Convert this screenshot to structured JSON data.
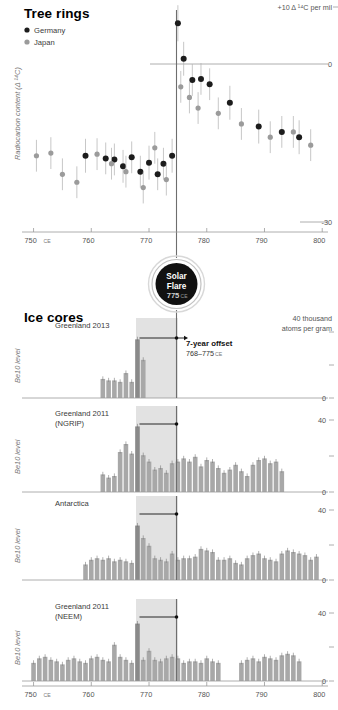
{
  "figure": {
    "sections": {
      "tree_rings": {
        "title": "Tree rings",
        "corner_note": "+10 Δ ¹⁴C per mil",
        "y_axis_label": "Radiocarbon content (Δ ¹⁴C)",
        "y_ticks": [
          {
            "label": "0",
            "value": 0
          },
          {
            "label": "-30",
            "value": -30
          }
        ],
        "legend": [
          {
            "label": "Germany",
            "color": "#1c1c1c"
          },
          {
            "label": "Japan",
            "color": "#9b9b9b"
          }
        ],
        "x_ticks": [
          "750",
          "760",
          "770",
          "780",
          "790",
          "800"
        ],
        "x_first_suffix": "CE"
      },
      "solar_flare_badge": {
        "line1": "Solar",
        "line2": "Flare",
        "year": "775",
        "era": "CE"
      },
      "ice_cores": {
        "title": "Ice cores",
        "corner_note_line1": "40 thousand",
        "corner_note_line2": "atoms per gram",
        "y_axis_label": "Be10 level",
        "annotation": {
          "bold": "7-year offset",
          "range": "768–775",
          "era": "CE"
        },
        "panels": [
          {
            "name": "Greenland 2013",
            "name2": "",
            "y_ticks": [
              "",
              "",
              "0"
            ]
          },
          {
            "name": "Greenland 2011",
            "name2": "(NGRIP)",
            "y_ticks": [
              "40",
              "",
              "0"
            ]
          },
          {
            "name": "Antarctica",
            "name2": "",
            "y_ticks": [
              "40",
              "",
              "0"
            ]
          },
          {
            "name": "Greenland 2011",
            "name2": "(NEEM)",
            "y_ticks": [
              "40",
              "",
              "0"
            ]
          }
        ],
        "x_ticks": [
          "750",
          "760",
          "770",
          "780",
          "790",
          "800"
        ],
        "x_first_suffix": "CE"
      }
    }
  },
  "chart_data": [
    {
      "type": "scatter",
      "title": "Tree rings",
      "xlabel": "Year (CE)",
      "ylabel": "Radiocarbon content (Δ ¹⁴C)",
      "xlim": [
        748,
        801
      ],
      "ylim": [
        -30,
        10
      ],
      "grid": false,
      "legend_position": "top-left",
      "annotations": [
        "+10 Δ ¹⁴C per mil",
        "Solar Flare 775 CE"
      ],
      "series": [
        {
          "name": "Germany",
          "color": "#1c1c1c",
          "points": [
            {
              "x": 759,
              "y": -17.5,
              "err": 3.2
            },
            {
              "x": 762.5,
              "y": -18.0,
              "err": 3.0
            },
            {
              "x": 764,
              "y": -18.2,
              "err": 3.0
            },
            {
              "x": 765.5,
              "y": -19.5,
              "err": 3.1
            },
            {
              "x": 767,
              "y": -17.8,
              "err": 3.0
            },
            {
              "x": 768.5,
              "y": -20.5,
              "err": 3.0
            },
            {
              "x": 770,
              "y": -18.8,
              "err": 3.2
            },
            {
              "x": 771.5,
              "y": -21.0,
              "err": 3.0
            },
            {
              "x": 772.5,
              "y": -19.0,
              "err": 3.0
            },
            {
              "x": 774,
              "y": -17.5,
              "err": 3.2
            },
            {
              "x": 775,
              "y": 7.5,
              "err": 3.4
            },
            {
              "x": 776,
              "y": 0.8,
              "err": 3.2
            },
            {
              "x": 777.5,
              "y": -3.2,
              "err": 3.0
            },
            {
              "x": 779,
              "y": -3.0,
              "err": 3.0
            },
            {
              "x": 780.5,
              "y": -4.0,
              "err": 3.0
            },
            {
              "x": 784,
              "y": -7.5,
              "err": 3.2
            },
            {
              "x": 789,
              "y": -12.0,
              "err": 3.2
            },
            {
              "x": 793,
              "y": -13.0,
              "err": 3.0
            },
            {
              "x": 796,
              "y": -14.0,
              "err": 3.2
            }
          ]
        },
        {
          "name": "Japan",
          "color": "#9b9b9b",
          "points": [
            {
              "x": 750.5,
              "y": -17.5,
              "err": 3.0
            },
            {
              "x": 753,
              "y": -17.0,
              "err": 3.0
            },
            {
              "x": 755,
              "y": -21.0,
              "err": 3.0
            },
            {
              "x": 757.5,
              "y": -22.5,
              "err": 3.0
            },
            {
              "x": 761,
              "y": -17.2,
              "err": 3.0
            },
            {
              "x": 763.5,
              "y": -19.0,
              "err": 3.0
            },
            {
              "x": 766,
              "y": -20.5,
              "err": 3.0
            },
            {
              "x": 769,
              "y": -23.5,
              "err": 3.0
            },
            {
              "x": 771,
              "y": -16.0,
              "err": 3.0
            },
            {
              "x": 773,
              "y": -22.0,
              "err": 3.0
            },
            {
              "x": 775.5,
              "y": -4.5,
              "err": 3.0
            },
            {
              "x": 777,
              "y": -6.5,
              "err": 3.0
            },
            {
              "x": 778.5,
              "y": -8.5,
              "err": 3.0
            },
            {
              "x": 782,
              "y": -9.5,
              "err": 3.0
            },
            {
              "x": 786,
              "y": -11.5,
              "err": 3.0
            },
            {
              "x": 791,
              "y": -14.0,
              "err": 3.0
            },
            {
              "x": 795,
              "y": -13.0,
              "err": 3.0
            },
            {
              "x": 798,
              "y": -15.5,
              "err": 3.0
            }
          ]
        }
      ]
    },
    {
      "type": "bar",
      "title": "Greenland 2013",
      "ylabel": "Be10 level",
      "xlabel": "Year (CE)",
      "xlim": [
        748,
        801
      ],
      "ylim": [
        0,
        45
      ],
      "highlight_band": [
        768,
        775
      ],
      "peak_year": 768,
      "x": [
        762,
        763,
        764,
        765,
        766,
        767,
        768,
        769
      ],
      "values": [
        13,
        12,
        12,
        11,
        17,
        11,
        40,
        26
      ]
    },
    {
      "type": "bar",
      "title": "Greenland 2011 (NGRIP)",
      "ylabel": "Be10 level",
      "xlabel": "Year (CE)",
      "xlim": [
        748,
        801
      ],
      "ylim": [
        0,
        45
      ],
      "highlight_band": [
        768,
        775
      ],
      "peak_year": 768,
      "x": [
        762,
        763,
        764,
        765,
        766,
        767,
        768,
        769,
        770,
        771,
        772,
        773,
        774,
        775,
        776,
        777,
        778,
        779,
        780,
        781,
        782,
        783,
        784,
        785,
        786,
        787,
        788,
        789,
        790,
        791,
        792,
        793
      ],
      "values": [
        11,
        9,
        10,
        25,
        30,
        24,
        41,
        23,
        19,
        14,
        15,
        12,
        18,
        19,
        21,
        19,
        22,
        16,
        20,
        19,
        15,
        12,
        14,
        17,
        13,
        10,
        17,
        20,
        21,
        18,
        19,
        13
      ]
    },
    {
      "type": "bar",
      "title": "Antarctica",
      "ylabel": "Be10 level",
      "xlabel": "Year (CE)",
      "xlim": [
        748,
        801
      ],
      "ylim": [
        0,
        45
      ],
      "highlight_band": [
        768,
        775
      ],
      "peak_year": 768,
      "x": [
        759,
        760,
        761,
        762,
        763,
        764,
        765,
        766,
        767,
        768,
        769,
        770,
        771,
        772,
        773,
        774,
        775,
        776,
        777,
        778,
        779,
        780,
        781,
        782,
        783,
        784,
        785,
        786,
        787,
        788,
        789,
        790,
        791,
        792,
        793,
        794,
        795,
        796,
        797,
        798,
        799
      ],
      "values": [
        10,
        13,
        14,
        13,
        14,
        12,
        13,
        12,
        11,
        35,
        27,
        22,
        14,
        13,
        12,
        17,
        13,
        14,
        14,
        15,
        20,
        19,
        18,
        13,
        13,
        14,
        11,
        10,
        14,
        16,
        17,
        14,
        13,
        12,
        17,
        19,
        18,
        17,
        16,
        13,
        15
      ]
    },
    {
      "type": "bar",
      "title": "Greenland 2011 (NEEM)",
      "ylabel": "Be10 level",
      "xlabel": "Year (CE)",
      "xlim": [
        748,
        801
      ],
      "ylim": [
        0,
        45
      ],
      "highlight_band": [
        768,
        775
      ],
      "peak_year": 768,
      "x": [
        750,
        751,
        752,
        753,
        754,
        755,
        756,
        757,
        758,
        759,
        760,
        761,
        762,
        763,
        764,
        765,
        766,
        767,
        768,
        769,
        770,
        771,
        772,
        773,
        774,
        775,
        776,
        777,
        778,
        779,
        780,
        781,
        782,
        786,
        787,
        788,
        789,
        790,
        791,
        792,
        793,
        794,
        795,
        796
      ],
      "values": [
        12,
        15,
        16,
        14,
        13,
        11,
        14,
        15,
        13,
        12,
        15,
        16,
        14,
        13,
        24,
        16,
        14,
        12,
        38,
        14,
        20,
        14,
        13,
        15,
        16,
        15,
        12,
        13,
        13,
        12,
        15,
        13,
        12,
        12,
        14,
        15,
        13,
        16,
        15,
        14,
        17,
        18,
        17,
        13
      ]
    }
  ]
}
